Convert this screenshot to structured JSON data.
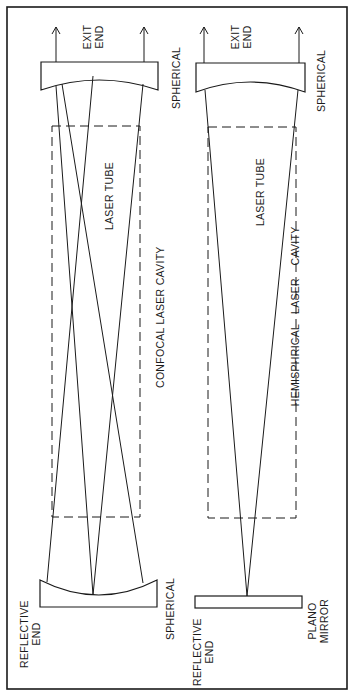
{
  "diagram": {
    "colors": {
      "ink": "#1a1a1a",
      "background": "#ffffff"
    },
    "left": {
      "title": "CONFOCAL LASER CAVITY",
      "tube_label": "LASER TUBE",
      "top_mirror": {
        "end_line1": "EXIT",
        "end_line2": "END",
        "type": "SPHERICAL"
      },
      "bottom_mirror": {
        "end_line1": "REFLECTIVE",
        "end_line2": "END",
        "type": "SPHERICAL"
      }
    },
    "right": {
      "title_part1": "HEMISPHRICAL",
      "title_part2": "LASER",
      "title_part3": "CAVITY",
      "tube_label": "LASER TUBE",
      "top_mirror": {
        "end_line1": "EXIT",
        "end_line2": "END",
        "type": "SPHERICAL"
      },
      "bottom_mirror": {
        "end_line1": "REFLECTIVE",
        "end_line2": "END",
        "type_line1": "PLANO",
        "type_line2": "MIRROR"
      }
    }
  }
}
